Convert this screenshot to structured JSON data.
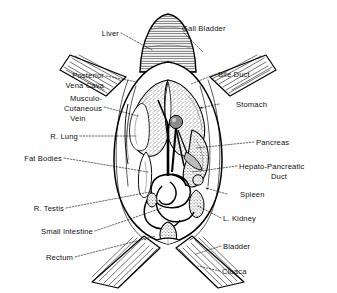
{
  "figure": {
    "background_color": "#ffffff",
    "ink_color": "#000000",
    "style": "black-and-white line engraving with hatching and stippling"
  },
  "labels": {
    "liver": "Liver",
    "gall_bladder": "Gall Bladder",
    "posterior_vena_cava_line1": "Posterior",
    "posterior_vena_cava_line2": "Vena Cava",
    "musculo_cutaneous_line1": "Musculo-",
    "musculo_cutaneous_line2": "Cutaneous",
    "musculo_cutaneous_line3": "Vein",
    "r_lung": "R. Lung",
    "fat_bodies": "Fat Bodies",
    "r_testis": "R. Testis",
    "small_intestine": "Small Intestine",
    "rectum": "Rectum",
    "bile_duct": "Bile Duct",
    "stomach": "Stomach",
    "pancreas": "Pancreas",
    "hepato_pancreatic_duct_line1": "Hepato-Pancreatic",
    "hepato_pancreatic_duct_line2": "Duct",
    "spleen": "Spleen",
    "l_kidney": "L. Kidney",
    "bladder": "Bladder",
    "cloaca": "Cloaca"
  },
  "structures": [
    {
      "name": "liver",
      "side": "left",
      "label": "Liver"
    },
    {
      "name": "gall-bladder",
      "side": "right",
      "label": "Gall Bladder"
    },
    {
      "name": "posterior-vena-cava",
      "side": "left",
      "label": "Posterior Vena Cava"
    },
    {
      "name": "musculo-cutaneous-vein",
      "side": "left",
      "label": "Musculo-Cutaneous Vein"
    },
    {
      "name": "right-lung",
      "side": "left",
      "label": "R. Lung"
    },
    {
      "name": "fat-bodies",
      "side": "left",
      "label": "Fat Bodies"
    },
    {
      "name": "right-testis",
      "side": "left",
      "label": "R. Testis"
    },
    {
      "name": "small-intestine",
      "side": "left",
      "label": "Small Intestine"
    },
    {
      "name": "rectum",
      "side": "left",
      "label": "Rectum"
    },
    {
      "name": "bile-duct",
      "side": "right",
      "label": "Bile Duct"
    },
    {
      "name": "stomach",
      "side": "right",
      "label": "Stomach"
    },
    {
      "name": "pancreas",
      "side": "right",
      "label": "Pancreas"
    },
    {
      "name": "hepato-pancreatic-duct",
      "side": "right",
      "label": "Hepato-Pancreatic Duct"
    },
    {
      "name": "spleen",
      "side": "right",
      "label": "Spleen"
    },
    {
      "name": "left-kidney",
      "side": "right",
      "label": "L. Kidney"
    },
    {
      "name": "bladder",
      "side": "right",
      "label": "Bladder"
    },
    {
      "name": "cloaca",
      "side": "right",
      "label": "Cloaca"
    }
  ]
}
